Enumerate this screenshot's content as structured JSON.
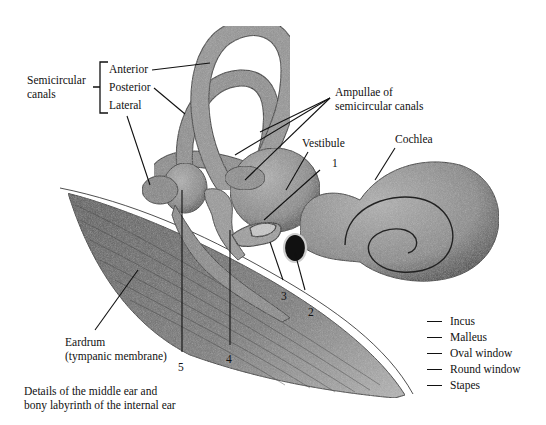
{
  "figure": {
    "caption": [
      "Details of the middle ear and",
      "bony labyrinth of the internal ear"
    ]
  },
  "labels": {
    "semicircular_canals": [
      "Semicircular",
      "canals"
    ],
    "anterior": "Anterior",
    "posterior": "Posterior",
    "lateral": "Lateral",
    "ampullae": [
      "Ampullae of",
      "semicircular canals"
    ],
    "vestibule": "Vestibule",
    "cochlea": "Cochlea",
    "eardrum": [
      "Eardrum",
      "(tympanic membrane)"
    ]
  },
  "numbers": [
    "1",
    "2",
    "3",
    "4",
    "5"
  ],
  "answer_key": [
    "Incus",
    "Malleus",
    "Oval window",
    "Round window",
    "Stapes"
  ],
  "colors": {
    "tissue_fill": "#8a8a8a",
    "tissue_dark": "#555555",
    "membrane": "#6e6e6e",
    "ink": "#111111"
  }
}
